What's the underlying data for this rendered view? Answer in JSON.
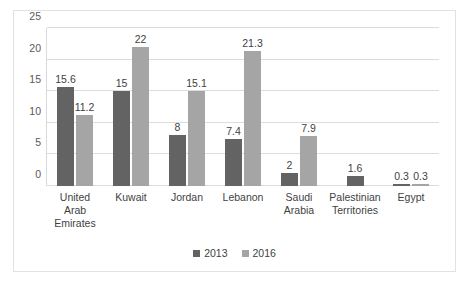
{
  "chart_data": {
    "type": "bar",
    "title": "",
    "subtitle": "",
    "xlabel": "",
    "ylabel": "",
    "ylim": [
      0,
      25
    ],
    "yticks": [
      0,
      5,
      10,
      15,
      20,
      25
    ],
    "ytick_labels": [
      "0",
      "5",
      "10",
      "15",
      "20",
      "25"
    ],
    "grid": true,
    "legend_position": "bottom",
    "categories": [
      "United Arab Emirates",
      "Kuwait",
      "Jordan",
      "Lebanon",
      "Saudi Arabia",
      "Palestinian Territories",
      "Egypt"
    ],
    "category_lines": [
      [
        "United",
        "Arab",
        "Emirates"
      ],
      [
        "Kuwait"
      ],
      [
        "Jordan"
      ],
      [
        "Lebanon"
      ],
      [
        "Saudi",
        "Arabia"
      ],
      [
        "Palestinian",
        "Territories"
      ],
      [
        "Egypt"
      ]
    ],
    "series": [
      {
        "name": "2013",
        "color": "#636363",
        "values": [
          15.6,
          15,
          8,
          7.4,
          2,
          1.6,
          0.3
        ],
        "labels": [
          "15.6",
          "15",
          "8",
          "7.4",
          "2",
          "1.6",
          "0.3"
        ]
      },
      {
        "name": "2016",
        "color": "#a5a5a5",
        "values": [
          11.2,
          22,
          15.1,
          21.3,
          7.9,
          null,
          0.3
        ],
        "labels": [
          "11.2",
          "22",
          "15.1",
          "21.3",
          "7.9",
          "",
          "0.3"
        ]
      }
    ]
  },
  "legend": {
    "items": [
      {
        "label": "2013",
        "color": "#636363"
      },
      {
        "label": "2016",
        "color": "#a5a5a5"
      }
    ]
  }
}
